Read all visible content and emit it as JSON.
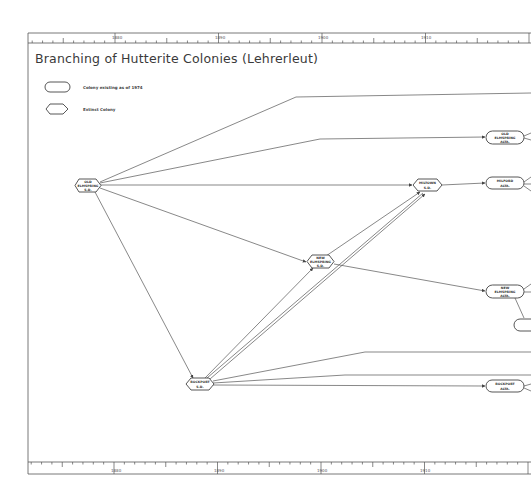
{
  "title": "Branching of Hutterite Colonies (Lehrerleut)",
  "legend": {
    "existing": "Colony existing as of 1974",
    "extinct": "Extinct Colony"
  },
  "axis": {
    "top_labels": [
      "1880",
      "1890",
      "1900",
      "1910"
    ],
    "bottom_labels": [
      "1880",
      "1890",
      "1900",
      "1910"
    ]
  },
  "nodes": [
    {
      "id": "root",
      "type": "extinct",
      "line1": "OLD",
      "line2": "ELMSPRING",
      "line3": "S.D."
    },
    {
      "id": "n2",
      "type": "existing",
      "line1": "OLD",
      "line2": "ELMSPRING",
      "line3": "ALTA."
    },
    {
      "id": "n3",
      "type": "extinct",
      "line1": "MILTOWN",
      "line2": "S.D."
    },
    {
      "id": "n4",
      "type": "existing",
      "line1": "MILFORD",
      "line2": "ALTA."
    },
    {
      "id": "n5",
      "type": "extinct",
      "line1": "NEW",
      "line2": "ELMSPRING",
      "line3": "S.D."
    },
    {
      "id": "n6",
      "type": "existing",
      "line1": "NEW",
      "line2": "ELMSPRING",
      "line3": "ALTA."
    },
    {
      "id": "n7",
      "type": "extinct",
      "line1": "ROCKPORT",
      "line2": "S.D."
    },
    {
      "id": "n8",
      "type": "existing",
      "line1": "ROCKPORT",
      "line2": "ALTA."
    }
  ],
  "colors": {
    "line": "#555555",
    "frame": "#444444",
    "background": "#ffffff"
  }
}
